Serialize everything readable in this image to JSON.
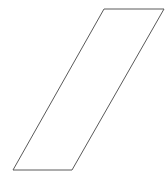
{
  "canvas": {
    "width": 167,
    "height": 179,
    "background_color": "#ffffff"
  },
  "figure": {
    "name": "parallelogram",
    "shape_type": "parallelogram",
    "fill_color": "none",
    "stroke_color": "#5a5a5a",
    "stroke_width": 1,
    "vertices": [
      {
        "label": "top-left",
        "x": 104,
        "y": 9
      },
      {
        "label": "top-right",
        "x": 164,
        "y": 9
      },
      {
        "label": "bottom-right",
        "x": 72,
        "y": 170
      },
      {
        "label": "bottom-left",
        "x": 13,
        "y": 170
      }
    ],
    "points_attr": "104,9 164,9 72,170 13,170",
    "edges": [
      {
        "name": "top-edge",
        "orientation": "horizontal",
        "length": 60
      },
      {
        "name": "right-edge",
        "orientation": "slanted",
        "length": 185
      },
      {
        "name": "bottom-edge",
        "orientation": "horizontal",
        "length": 59
      },
      {
        "name": "left-edge",
        "orientation": "slanted",
        "length": 185
      }
    ]
  }
}
